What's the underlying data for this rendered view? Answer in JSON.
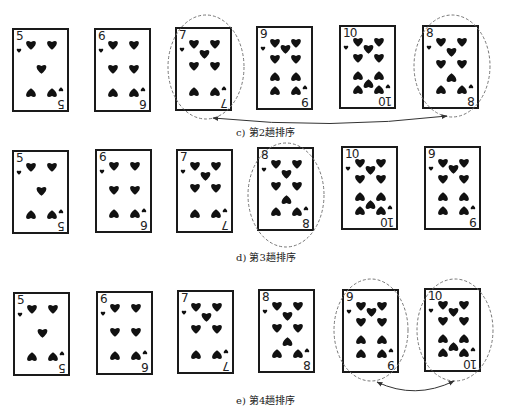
{
  "figure": {
    "rows": [
      {
        "caption": "c) 第2趟排序",
        "cards": [
          {
            "rank": "5",
            "suit": "heart",
            "highlighted": false
          },
          {
            "rank": "6",
            "suit": "heart",
            "highlighted": false
          },
          {
            "rank": "7",
            "suit": "heart",
            "highlighted": true
          },
          {
            "rank": "9",
            "suit": "heart",
            "highlighted": false
          },
          {
            "rank": "10",
            "suit": "heart",
            "highlighted": false
          },
          {
            "rank": "8",
            "suit": "heart",
            "highlighted": true
          }
        ],
        "swap": {
          "from_card": 3,
          "to_card": 6,
          "arrow": "double-headed"
        }
      },
      {
        "caption": "d) 第3趟排序",
        "cards": [
          {
            "rank": "5",
            "suit": "heart",
            "highlighted": false
          },
          {
            "rank": "6",
            "suit": "heart",
            "highlighted": false
          },
          {
            "rank": "7",
            "suit": "heart",
            "highlighted": false
          },
          {
            "rank": "8",
            "suit": "heart",
            "highlighted": true
          },
          {
            "rank": "10",
            "suit": "heart",
            "highlighted": false
          },
          {
            "rank": "9",
            "suit": "heart",
            "highlighted": false
          }
        ],
        "swap": null
      },
      {
        "caption": "e) 第4趟排序",
        "cards": [
          {
            "rank": "5",
            "suit": "heart",
            "highlighted": false
          },
          {
            "rank": "6",
            "suit": "heart",
            "highlighted": false
          },
          {
            "rank": "7",
            "suit": "heart",
            "highlighted": false
          },
          {
            "rank": "8",
            "suit": "heart",
            "highlighted": false
          },
          {
            "rank": "9",
            "suit": "heart",
            "highlighted": true
          },
          {
            "rank": "10",
            "suit": "heart",
            "highlighted": true
          }
        ],
        "swap": {
          "from_card": 5,
          "to_card": 6,
          "arrow": "double-headed"
        }
      }
    ],
    "colors": {
      "ink": "#1a1a1a",
      "dashed": "#777777",
      "background": "#ffffff"
    }
  }
}
